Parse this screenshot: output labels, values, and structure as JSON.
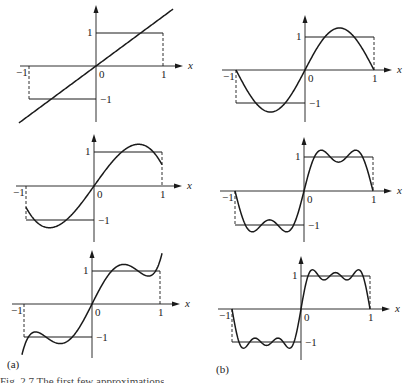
{
  "figure": {
    "panel_labels": {
      "a": "(a)",
      "b": "(b)"
    },
    "caption": "Fig. 2.7  The first few approximations",
    "axis_labels": {
      "x": "x",
      "origin": "0",
      "one": "1",
      "minus_one": "−1"
    },
    "colors": {
      "ink": "#1a1a1a",
      "background": "#ffffff"
    }
  },
  "chart_data": [
    {
      "type": "line",
      "panel": "a",
      "row": 1,
      "title": "Legendre approximation of sign(x), 1 term",
      "xlabel": "x",
      "xlim": [
        -1,
        1
      ],
      "ylim": [
        -1,
        1
      ],
      "ticks_x": [
        "-1",
        "0",
        "1"
      ],
      "ticks_y": [
        "1",
        "-1"
      ],
      "series": [
        {
          "name": "target step (square wave)",
          "style": "solid with dashed verticals at x=±1",
          "x": [
            -1,
            0,
            0,
            1
          ],
          "y": [
            -1,
            -1,
            1,
            1
          ]
        },
        {
          "name": "approximation",
          "kind": "legendre",
          "coefficients": {
            "P1": 1.5
          }
        }
      ],
      "origin_px": [
        96,
        66
      ],
      "unit_px": [
        67,
        33
      ],
      "ytop_px": 5,
      "ybot_px": 122,
      "xleft_px": 20,
      "xright_px": 183
    },
    {
      "type": "line",
      "panel": "a",
      "row": 2,
      "title": "Legendre approximation of sign(x), 2 terms",
      "xlabel": "x",
      "xlim": [
        -1,
        1
      ],
      "ylim": [
        -1,
        1
      ],
      "series": [
        {
          "name": "target step (square wave)",
          "x": [
            -1,
            0,
            0,
            1
          ],
          "y": [
            -1,
            -1,
            1,
            1
          ]
        },
        {
          "name": "approximation",
          "kind": "legendre",
          "coefficients": {
            "P1": 1.5,
            "P3": -0.875
          }
        }
      ],
      "origin_px": [
        94,
        186
      ],
      "unit_px": [
        68,
        34
      ],
      "ytop_px": 134,
      "ybot_px": 242,
      "xleft_px": 16,
      "xright_px": 182
    },
    {
      "type": "line",
      "panel": "a",
      "row": 3,
      "title": "Legendre approximation of sign(x), 3 terms",
      "xlabel": "x",
      "xlim": [
        -1,
        1
      ],
      "ylim": [
        -1,
        1
      ],
      "series": [
        {
          "name": "target step (square wave)",
          "x": [
            -1,
            0,
            0,
            1
          ],
          "y": [
            -1,
            -1,
            1,
            1
          ]
        },
        {
          "name": "approximation",
          "kind": "legendre",
          "coefficients": {
            "P1": 1.5,
            "P3": -0.875,
            "P5": 0.6875
          }
        }
      ],
      "origin_px": [
        92,
        304
      ],
      "unit_px": [
        68,
        33
      ],
      "ytop_px": 250,
      "ybot_px": 358,
      "xleft_px": 12,
      "xright_px": 180
    },
    {
      "type": "line",
      "panel": "b",
      "row": 1,
      "title": "Fourier sine approximation of square wave, 1 term",
      "xlabel": "x",
      "xlim": [
        -1,
        1
      ],
      "ylim": [
        -1,
        1
      ],
      "series": [
        {
          "name": "target step (square wave)",
          "x": [
            -1,
            0,
            0,
            1
          ],
          "y": [
            -1,
            -1,
            1,
            1
          ]
        },
        {
          "name": "approximation",
          "kind": "fourier_sine",
          "terms": 1
        }
      ],
      "origin_px": [
        305,
        70
      ],
      "unit_px": [
        69,
        33
      ],
      "ytop_px": 15,
      "ybot_px": 122,
      "xleft_px": 222,
      "xright_px": 392
    },
    {
      "type": "line",
      "panel": "b",
      "row": 2,
      "title": "Fourier sine approximation of square wave, 2 terms",
      "xlabel": "x",
      "xlim": [
        -1,
        1
      ],
      "ylim": [
        -1,
        1
      ],
      "series": [
        {
          "name": "target step (square wave)",
          "x": [
            -1,
            0,
            0,
            1
          ],
          "y": [
            -1,
            -1,
            1,
            1
          ]
        },
        {
          "name": "approximation",
          "kind": "fourier_sine",
          "terms": 2
        }
      ],
      "origin_px": [
        304,
        191
      ],
      "unit_px": [
        69,
        34
      ],
      "ytop_px": 137,
      "ybot_px": 242,
      "xleft_px": 220,
      "xright_px": 392
    },
    {
      "type": "line",
      "panel": "b",
      "row": 3,
      "title": "Fourier sine approximation of square wave, 3 terms",
      "xlabel": "x",
      "xlim": [
        -1,
        1
      ],
      "ylim": [
        -1,
        1
      ],
      "series": [
        {
          "name": "target step (square wave)",
          "x": [
            -1,
            0,
            0,
            1
          ],
          "y": [
            -1,
            -1,
            1,
            1
          ]
        },
        {
          "name": "approximation",
          "kind": "fourier_sine",
          "terms": 3
        }
      ],
      "origin_px": [
        301,
        309
      ],
      "unit_px": [
        69,
        33
      ],
      "ytop_px": 256,
      "ybot_px": 360,
      "xleft_px": 218,
      "xright_px": 390
    }
  ]
}
